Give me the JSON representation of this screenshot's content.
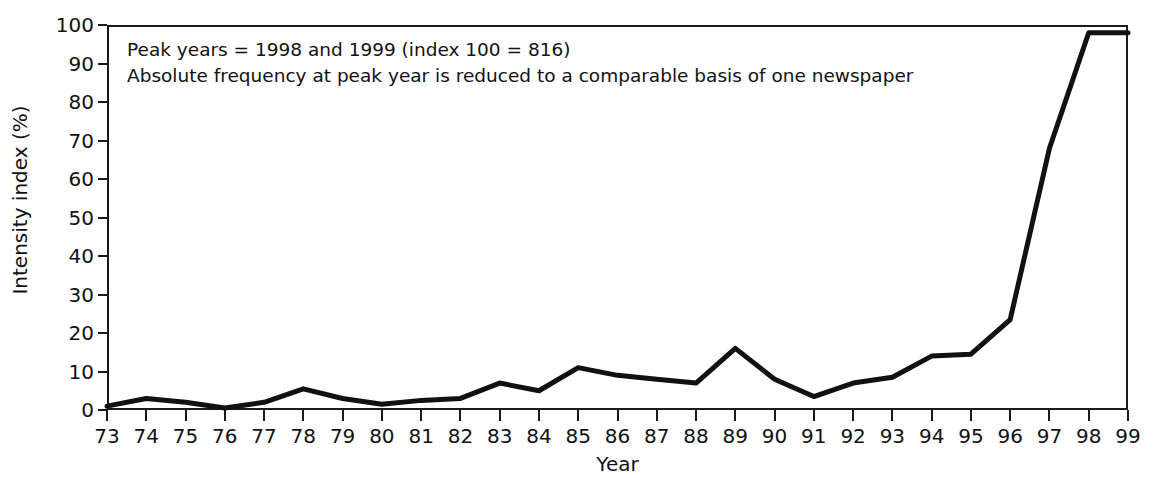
{
  "chart_data": {
    "type": "line",
    "title": "",
    "xlabel": "Year",
    "ylabel": "Intensity index (%)",
    "xlim": [
      73,
      99
    ],
    "ylim": [
      0,
      100
    ],
    "grid": false,
    "legend": false,
    "x": [
      73,
      74,
      75,
      76,
      77,
      78,
      79,
      80,
      81,
      82,
      83,
      84,
      85,
      86,
      87,
      88,
      89,
      90,
      91,
      92,
      93,
      94,
      95,
      96,
      97,
      98,
      99
    ],
    "xtick_labels": [
      "73",
      "74",
      "75",
      "76",
      "77",
      "78",
      "79",
      "80",
      "81",
      "82",
      "83",
      "84",
      "85",
      "86",
      "87",
      "88",
      "89",
      "90",
      "91",
      "92",
      "93",
      "94",
      "95",
      "96",
      "97",
      "98",
      "99"
    ],
    "ytick_labels": [
      "0",
      "10",
      "20",
      "30",
      "40",
      "50",
      "60",
      "70",
      "80",
      "90",
      "100"
    ],
    "ytick_values": [
      0,
      10,
      20,
      30,
      40,
      50,
      60,
      70,
      80,
      90,
      100
    ],
    "series": [
      {
        "name": "Intensity index",
        "color": "#111111",
        "values": [
          1,
          3,
          2,
          0.5,
          2,
          5.5,
          3,
          1.5,
          2.5,
          3,
          7,
          5,
          11,
          9,
          8,
          7,
          16,
          8,
          3.5,
          7,
          8.5,
          14,
          14.5,
          23.5,
          68,
          98,
          98
        ]
      }
    ],
    "annotations": [
      "Peak years = 1998 and 1999 (index 100 = 816)",
      "Absolute frequency at peak year is reduced to a comparable basis of one newspaper"
    ]
  }
}
